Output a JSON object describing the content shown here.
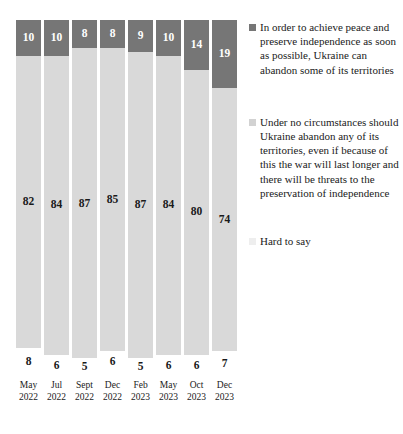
{
  "chart_data": {
    "type": "bar",
    "subtype": "stacked-bar-100",
    "title": "",
    "subtitle": "",
    "xlabel": "",
    "ylabel": "",
    "ylim": [
      0,
      100
    ],
    "grid": false,
    "legend_position": "right",
    "categories": [
      "May 2022",
      "Jul 2022",
      "Sept 2022",
      "Dec 2022",
      "Feb 2023",
      "May 2023",
      "Oct 2023",
      "Dec 2023"
    ],
    "category_lines": [
      {
        "month": "May",
        "year": "2022"
      },
      {
        "month": "Jul",
        "year": "2022"
      },
      {
        "month": "Sept",
        "year": "2022"
      },
      {
        "month": "Dec",
        "year": "2022"
      },
      {
        "month": "Feb",
        "year": "2023"
      },
      {
        "month": "May",
        "year": "2023"
      },
      {
        "month": "Oct",
        "year": "2023"
      },
      {
        "month": "Dec",
        "year": "2023"
      }
    ],
    "series": [
      {
        "name": "In order to achieve peace and preserve independence as soon as possible, Ukraine can abandon some of its territories",
        "color": "#767676",
        "values": [
          10,
          10,
          8,
          8,
          9,
          10,
          14,
          19
        ]
      },
      {
        "name": "Under no circumstances should Ukraine abandon any of its territories, even if because of this the war will last longer and there will be threats to the preservation of independence",
        "color": "#d9d9d9",
        "values": [
          82,
          84,
          87,
          85,
          87,
          84,
          80,
          74
        ]
      },
      {
        "name": "Hard to say",
        "color": "#ffffff",
        "values": [
          8,
          6,
          5,
          6,
          5,
          6,
          6,
          7
        ]
      }
    ]
  },
  "legend": {
    "items": [
      {
        "label": "In order to achieve peace and preserve independence as soon as possible, Ukraine can abandon some of its territories",
        "color": "#767676"
      },
      {
        "label": "Under no circumstances should Ukraine abandon any of its territories, even if because of this the war will last longer and there will be threats to the preservation of independence",
        "color": "#d2d2d2"
      },
      {
        "label": "Hard to say",
        "color": "#eeeeee"
      }
    ]
  }
}
